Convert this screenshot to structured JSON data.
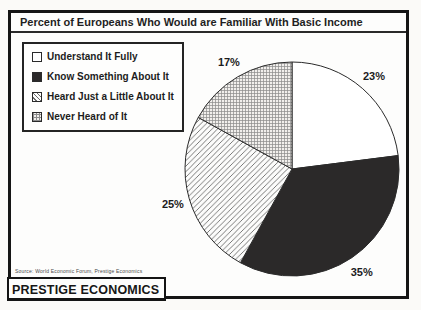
{
  "title": "Percent of Europeans Who Would are Familiar With Basic Income",
  "source_note": "Source: World Economic Forum, Prestige Economics",
  "logo_text": "PRESTIGE ECONOMICS",
  "chart_data": {
    "type": "pie",
    "title": "Percent of Europeans Who Would are Familiar With Basic Income",
    "categories": [
      "Understand It Fully",
      "Know Something About It",
      "Heard Just a Little About It",
      "Never Heard of It"
    ],
    "values": [
      23,
      35,
      25,
      17
    ],
    "labels": [
      "23%",
      "35%",
      "25%",
      "17%"
    ],
    "unit": "percent",
    "start_angle": "12-oclock",
    "direction": "clockwise",
    "legend_position": "upper-left",
    "slice_styles": [
      {
        "pattern": "solid",
        "fill": "#ffffff"
      },
      {
        "pattern": "solid",
        "fill": "#2b2929"
      },
      {
        "pattern": "diag",
        "fill": "#ffffff",
        "line_color": "#5a5a5a"
      },
      {
        "pattern": "grid",
        "fill": "#f1efec",
        "line_color": "#8c8c8c"
      }
    ],
    "colors": {
      "outline": "#2b2b2b",
      "text": "#1c1c1c"
    }
  }
}
